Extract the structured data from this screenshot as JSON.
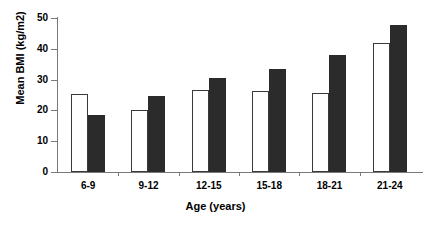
{
  "chart_data": {
    "type": "bar",
    "title": "",
    "xlabel": "Age (years)",
    "ylabel": "Mean BMI (kg/m2)",
    "categories": [
      "6-9",
      "9-12",
      "12-15",
      "15-18",
      "18-21",
      "21-24"
    ],
    "series": [
      {
        "name": "white-series",
        "color": "#ffffff",
        "values": [
          25.4,
          20.0,
          26.6,
          26.2,
          25.8,
          41.9
        ]
      },
      {
        "name": "black-series",
        "color": "#2b2b2b",
        "values": [
          18.5,
          24.6,
          30.5,
          33.6,
          37.9,
          47.7
        ]
      }
    ],
    "ylim": [
      0,
      50
    ],
    "yticks": [
      0,
      10,
      20,
      30,
      40,
      50
    ],
    "ytick_labels": [
      "0",
      "10",
      "20",
      "30",
      "40",
      "50"
    ],
    "grid": false,
    "legend": "none"
  }
}
